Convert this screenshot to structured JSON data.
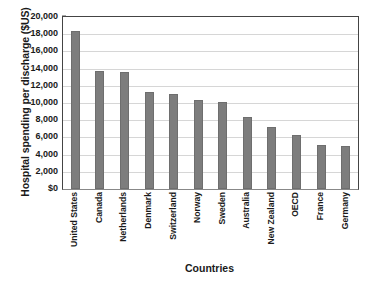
{
  "chart_data": {
    "type": "bar",
    "title": "",
    "xlabel": "Countries",
    "ylabel": "Hospital spending per discharge ($US)",
    "categories": [
      "United States",
      "Canada",
      "Netherlands",
      "Denmark",
      "Switzerland",
      "Norway",
      "Sweden",
      "Australia",
      "New Zealand",
      "OECD",
      "France",
      "Germany"
    ],
    "values": [
      18400,
      13700,
      13600,
      11300,
      11100,
      10400,
      10100,
      8400,
      7200,
      6300,
      5100,
      5000
    ],
    "ylim": [
      0,
      20000
    ],
    "ytick_values": [
      0,
      2000,
      4000,
      6000,
      8000,
      10000,
      12000,
      14000,
      16000,
      18000,
      20000
    ],
    "ytick_labels": [
      "$0",
      "2,000",
      "4,000",
      "6,000",
      "8,000",
      "10,000",
      "12,000",
      "14,000",
      "16,000",
      "18,000",
      "20,000"
    ],
    "grid": true,
    "legend": false,
    "bar_color": "#7d7d7d",
    "grid_color": "#d6d6d6",
    "axis_color": "#444444",
    "text_color": "#1a1a1a"
  }
}
